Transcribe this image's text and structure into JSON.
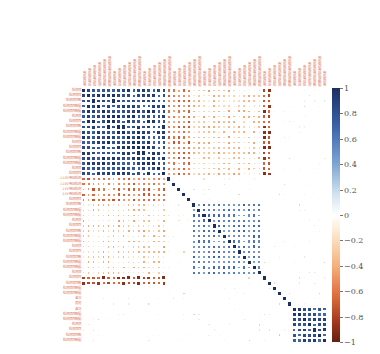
{
  "chart_data": {
    "type": "heatmap",
    "title": "",
    "subtitle": "",
    "xlabel": "",
    "ylabel": "",
    "n_variables": 49,
    "colorbar": {
      "min": -1,
      "max": 1,
      "ticks": [
        "1",
        "0.8",
        "0.6",
        "0.4",
        "0.2",
        "0",
        "−0.2",
        "−0.4",
        "−0.6",
        "−0.8",
        "−1"
      ],
      "colors": {
        "pos": "#1b2f63",
        "zero": "#ffffff",
        "neg": "#63200e"
      }
    },
    "blocks": [
      {
        "name": "block-A",
        "rows": [
          0,
          16
        ],
        "cols": [
          0,
          16
        ],
        "corr": 0.85,
        "note": "strong positive cluster, top-left"
      },
      {
        "name": "block-B",
        "rows": [
          17,
          21
        ],
        "cols": [
          0,
          16
        ],
        "corr": -0.55,
        "note": "voltage detection rows, negative vs block A"
      },
      {
        "name": "block-C",
        "rows": [
          22,
          35
        ],
        "cols": [
          22,
          35
        ],
        "corr": 0.55,
        "note": "second positive cluster, centre"
      },
      {
        "name": "block-D",
        "rows": [
          22,
          35
        ],
        "cols": [
          0,
          16
        ],
        "corr": -0.3,
        "note": "mild negative"
      },
      {
        "name": "block-E",
        "rows": [
          36,
          37
        ],
        "cols": [
          0,
          16
        ],
        "corr": -0.75,
        "note": "strong negative band"
      },
      {
        "name": "block-F",
        "rows": [
          42,
          48
        ],
        "cols": [
          42,
          48
        ],
        "corr": 0.8,
        "note": "small bottom-right positive cluster"
      }
    ],
    "row_labels_sample": [
      "110V电压检测",
      "110V电压检测",
      "24V电压检测",
      "24V电压检测",
      "备注",
      "其他",
      "备注"
    ],
    "legend_position": "right",
    "grid": false
  }
}
